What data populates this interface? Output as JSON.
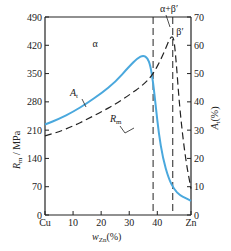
{
  "chart_data": {
    "type": "line",
    "title": "",
    "xlabel": "w_Zn(%)",
    "xlabel_main": "w",
    "xlabel_sub": "Zn",
    "xlabel_suffix": "(%)",
    "ylabel_left": "R_m / MPa",
    "ylabel_left_main": "R",
    "ylabel_left_sub": "m",
    "ylabel_left_suffix": " / MPa",
    "ylabel_right": "A_t(%)",
    "ylabel_right_main": "A",
    "ylabel_right_sub": "t",
    "ylabel_right_suffix": "(%)",
    "xlim": [
      0,
      52
    ],
    "ylim_left": [
      0,
      490
    ],
    "ylim_right": [
      0,
      70
    ],
    "x_ticks": [
      {
        "value": 0,
        "label": "Cu"
      },
      {
        "value": 10,
        "label": "10"
      },
      {
        "value": 20,
        "label": "20"
      },
      {
        "value": 30,
        "label": "30"
      },
      {
        "value": 40,
        "label": "40"
      },
      {
        "value": 52,
        "label": "Zn"
      }
    ],
    "y_left_ticks": [
      "0",
      "70",
      "140",
      "210",
      "280",
      "350",
      "420",
      "490"
    ],
    "y_right_ticks": [
      "0",
      "10",
      "20",
      "30",
      "40",
      "50",
      "60",
      "70"
    ],
    "phase_boundaries": [
      38.5,
      45.5
    ],
    "phase_labels": [
      "α",
      "α+β′",
      "β′"
    ],
    "series": [
      {
        "name": "A_t",
        "label_main": "A",
        "label_sub": "t",
        "axis": "right",
        "style": "solid",
        "color": "#4aa8dd",
        "x": [
          0,
          5,
          10,
          15,
          20,
          25,
          30,
          33,
          35,
          36.5,
          37.5,
          38.5,
          39.5,
          40.5,
          42,
          44,
          46,
          48,
          50,
          52
        ],
        "y": [
          32,
          34,
          36.5,
          39.5,
          43,
          47,
          52.5,
          55.5,
          56.5,
          55.5,
          53,
          47,
          38,
          29,
          20,
          13,
          9,
          7,
          6,
          5
        ]
      },
      {
        "name": "R_m",
        "label_main": "R",
        "label_sub": "m",
        "axis": "left",
        "style": "dashed",
        "color": "#222222",
        "x": [
          0,
          5,
          10,
          15,
          20,
          25,
          30,
          35,
          38.5,
          42,
          45.5,
          46.5,
          48,
          50,
          52
        ],
        "y": [
          196,
          206,
          220,
          237,
          255,
          274,
          297,
          322,
          348,
          395,
          455,
          400,
          260,
          140,
          65
        ]
      }
    ]
  }
}
